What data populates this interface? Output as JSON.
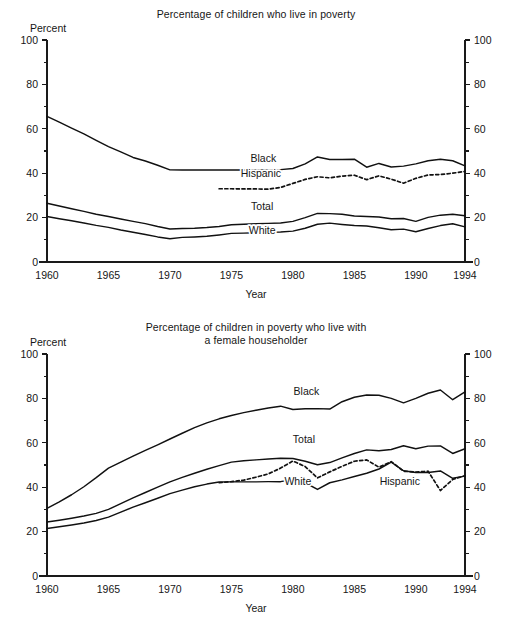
{
  "page": {
    "background": "#ffffff",
    "line_color": "#111111",
    "text_color": "#161616"
  },
  "chart_data": [
    {
      "id": "poverty-rate",
      "type": "line",
      "title": "Percentage of children who live in poverty",
      "subtitle": "",
      "xlabel": "Year",
      "ylabel": "Percent",
      "ylabel_right": "Percent",
      "ylim": [
        0,
        100
      ],
      "xlim": [
        1960,
        1994
      ],
      "yticks": [
        0,
        20,
        40,
        60,
        80,
        100
      ],
      "yticks_minor": [
        10,
        30,
        50,
        70,
        90
      ],
      "xticks": [
        1960,
        1965,
        1970,
        1975,
        1980,
        1985,
        1990,
        1994
      ],
      "grid": false,
      "legend": "inline-labels",
      "series": [
        {
          "name": "Black",
          "style": "solid",
          "label_x": 1977.6,
          "label_y": 45.0,
          "x": [
            1960,
            1961,
            1962,
            1963,
            1964,
            1965,
            1966,
            1967,
            1968,
            1969,
            1970,
            1971,
            1972,
            1973,
            1974,
            1975,
            1976,
            1977,
            1978,
            1979,
            1980,
            1981,
            1982,
            1983,
            1984,
            1985,
            1986,
            1987,
            1988,
            1989,
            1990,
            1991,
            1992,
            1993,
            1994
          ],
          "values": [
            65.6,
            63.0,
            60.3,
            57.7,
            54.8,
            52.0,
            49.6,
            47.1,
            45.5,
            43.6,
            41.5,
            41.4,
            41.4,
            41.4,
            41.4,
            41.4,
            41.4,
            41.5,
            41.5,
            41.6,
            42.1,
            44.2,
            47.3,
            46.2,
            46.2,
            46.3,
            42.7,
            44.4,
            42.8,
            43.2,
            44.2,
            45.6,
            46.3,
            45.6,
            43.3
          ]
        },
        {
          "name": "Hispanic",
          "style": "dashed",
          "label_x": 1977.4,
          "label_y": 38.3,
          "x": [
            1974,
            1975,
            1976,
            1977,
            1978,
            1979,
            1980,
            1981,
            1982,
            1983,
            1984,
            1985,
            1986,
            1987,
            1988,
            1989,
            1990,
            1991,
            1992,
            1993,
            1994
          ],
          "values": [
            33.0,
            33.0,
            32.9,
            32.9,
            32.8,
            33.6,
            35.4,
            37.2,
            38.4,
            37.9,
            38.7,
            39.1,
            37.1,
            38.8,
            37.3,
            35.5,
            37.7,
            39.2,
            39.4,
            40.0,
            40.8
          ]
        },
        {
          "name": "Total",
          "style": "solid",
          "label_x": 1977.5,
          "label_y": 23.5,
          "x": [
            1960,
            1961,
            1962,
            1963,
            1964,
            1965,
            1966,
            1967,
            1968,
            1969,
            1970,
            1971,
            1972,
            1973,
            1974,
            1975,
            1976,
            1977,
            1978,
            1979,
            1980,
            1981,
            1982,
            1983,
            1984,
            1985,
            1986,
            1987,
            1988,
            1989,
            1990,
            1991,
            1992,
            1993,
            1994
          ],
          "values": [
            26.5,
            25.2,
            24.0,
            22.8,
            21.5,
            20.5,
            19.4,
            18.3,
            17.3,
            16.0,
            14.9,
            15.1,
            15.2,
            15.5,
            16.0,
            16.8,
            17.0,
            17.2,
            17.4,
            17.6,
            18.3,
            20.0,
            21.9,
            21.8,
            21.5,
            20.7,
            20.5,
            20.3,
            19.5,
            19.6,
            18.3,
            20.1,
            21.1,
            21.5,
            20.8
          ]
        },
        {
          "name": "White",
          "style": "solid",
          "label_x": 1977.5,
          "label_y": 12.6,
          "x": [
            1960,
            1961,
            1962,
            1963,
            1964,
            1965,
            1966,
            1967,
            1968,
            1969,
            1970,
            1971,
            1972,
            1973,
            1974,
            1975,
            1976,
            1977,
            1978,
            1979,
            1980,
            1981,
            1982,
            1983,
            1984,
            1985,
            1986,
            1987,
            1988,
            1989,
            1990,
            1991,
            1992,
            1993,
            1994
          ],
          "values": [
            20.5,
            19.5,
            18.6,
            17.6,
            16.5,
            15.6,
            14.4,
            13.4,
            12.4,
            11.3,
            10.5,
            11.1,
            11.3,
            11.6,
            12.2,
            12.9,
            13.0,
            13.2,
            13.4,
            13.5,
            13.9,
            15.2,
            17.0,
            17.5,
            16.9,
            16.4,
            16.2,
            15.4,
            14.5,
            14.8,
            13.6,
            15.1,
            16.4,
            17.2,
            15.8
          ]
        }
      ]
    },
    {
      "id": "female-householder",
      "type": "line",
      "title": "Percentage of children in poverty who live with",
      "subtitle": "a female householder",
      "xlabel": "Year",
      "ylabel": "Percent",
      "ylabel_right": "Percent",
      "ylim": [
        0,
        100
      ],
      "xlim": [
        1960,
        1994
      ],
      "yticks": [
        0,
        20,
        40,
        60,
        80,
        100
      ],
      "yticks_minor": [
        10,
        30,
        50,
        70,
        90
      ],
      "xticks": [
        1960,
        1965,
        1970,
        1975,
        1980,
        1985,
        1990,
        1994
      ],
      "grid": false,
      "legend": "inline-labels",
      "series": [
        {
          "name": "Black",
          "style": "solid",
          "label_x": 1981.1,
          "label_y": 81.5,
          "x": [
            1960,
            1961,
            1962,
            1963,
            1964,
            1965,
            1966,
            1967,
            1968,
            1969,
            1970,
            1971,
            1972,
            1973,
            1974,
            1975,
            1976,
            1977,
            1978,
            1979,
            1980,
            1981,
            1982,
            1983,
            1984,
            1985,
            1986,
            1987,
            1988,
            1989,
            1990,
            1991,
            1992,
            1993,
            1994
          ],
          "values": [
            30.5,
            33.4,
            36.6,
            40.2,
            44.3,
            48.6,
            51.3,
            54.0,
            56.6,
            59.1,
            61.7,
            64.3,
            66.8,
            69.0,
            70.8,
            72.3,
            73.6,
            74.7,
            75.7,
            76.5,
            75.0,
            75.3,
            75.4,
            75.2,
            78.5,
            80.5,
            81.5,
            81.4,
            80.0,
            78.0,
            80.0,
            82.3,
            83.8,
            79.4,
            82.9
          ]
        },
        {
          "name": "Total",
          "style": "solid",
          "label_x": 1980.9,
          "label_y": 60.0,
          "x": [
            1960,
            1961,
            1962,
            1963,
            1964,
            1965,
            1966,
            1967,
            1968,
            1969,
            1970,
            1971,
            1972,
            1973,
            1974,
            1975,
            1976,
            1977,
            1978,
            1979,
            1980,
            1981,
            1982,
            1983,
            1984,
            1985,
            1986,
            1987,
            1988,
            1989,
            1990,
            1991,
            1992,
            1993,
            1994
          ],
          "values": [
            24.3,
            25.1,
            26.0,
            27.0,
            28.2,
            30.0,
            32.6,
            35.2,
            37.6,
            40.0,
            42.4,
            44.4,
            46.3,
            48.1,
            49.7,
            51.3,
            51.9,
            52.3,
            52.7,
            53.0,
            52.9,
            51.7,
            50.1,
            51.1,
            53.2,
            55.2,
            56.8,
            56.4,
            57.0,
            58.7,
            57.3,
            58.5,
            58.6,
            55.2,
            57.3
          ]
        },
        {
          "name": "White",
          "style": "solid",
          "label_x": 1980.4,
          "label_y": 41.0,
          "x": [
            1960,
            1961,
            1962,
            1963,
            1964,
            1965,
            1966,
            1967,
            1968,
            1969,
            1970,
            1971,
            1972,
            1973,
            1974,
            1975,
            1976,
            1977,
            1978,
            1979,
            1980,
            1981,
            1982,
            1983,
            1984,
            1985,
            1986,
            1987,
            1988,
            1989,
            1990,
            1991,
            1992,
            1993,
            1994
          ],
          "values": [
            21.4,
            22.2,
            23.0,
            23.9,
            25.0,
            26.5,
            28.8,
            31.0,
            33.0,
            35.0,
            37.1,
            38.7,
            40.2,
            41.4,
            42.3,
            42.4,
            42.4,
            42.4,
            42.5,
            42.5,
            43.5,
            42.0,
            39.0,
            42.0,
            43.3,
            44.8,
            46.3,
            48.2,
            51.3,
            47.4,
            46.6,
            46.6,
            47.3,
            44.0,
            45.0
          ]
        },
        {
          "name": "Hispanic",
          "style": "dashed",
          "label_x": 1988.7,
          "label_y": 40.8,
          "x": [
            1974,
            1975,
            1976,
            1977,
            1978,
            1979,
            1980,
            1981,
            1982,
            1983,
            1984,
            1985,
            1986,
            1987,
            1988,
            1989,
            1990,
            1991,
            1992,
            1993,
            1994
          ],
          "values": [
            42.0,
            42.5,
            43.2,
            44.5,
            46.0,
            48.6,
            51.8,
            49.3,
            44.2,
            46.9,
            49.4,
            51.7,
            52.3,
            49.0,
            51.5,
            47.2,
            46.8,
            47.2,
            38.5,
            43.5,
            45.2
          ]
        }
      ]
    }
  ]
}
